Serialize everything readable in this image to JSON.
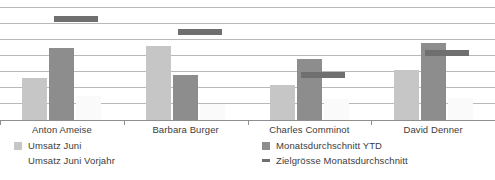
{
  "chart_data": {
    "type": "bar",
    "title": "",
    "xlabel": "",
    "ylabel": "",
    "grid": true,
    "legend_position": "bottom",
    "ylim": [
      0,
      7
    ],
    "gridline_values": [
      1,
      2,
      3,
      4,
      5,
      6,
      7
    ],
    "categories": [
      "Anton Ameise",
      "Barbara Burger",
      "Charles Comminot",
      "David Denner"
    ],
    "series": [
      {
        "name": "Umsatz Juni",
        "color": "#c6c6c6",
        "values": [
          2.6,
          4.6,
          2.2,
          3.1
        ]
      },
      {
        "name": "Monatsdurchschnitt YTD",
        "color": "#8d8d8d",
        "values": [
          4.5,
          2.8,
          3.8,
          4.8
        ]
      },
      {
        "name": "Umsatz Juni Vorjahr",
        "color": "#fafafa",
        "values": [
          1.5,
          1.0,
          1.3,
          1.4
        ]
      }
    ],
    "target_marker": {
      "name": "Zielgrösse Monatsdurchschnitt",
      "color": "#6f6f6f",
      "values": [
        6.1,
        5.3,
        2.6,
        4.0
      ]
    }
  },
  "legend": {
    "left": [
      {
        "label": "Umsatz Juni",
        "swatch": "s1"
      },
      {
        "label": "Umsatz Juni Vorjahr",
        "swatch": "s3"
      }
    ],
    "right": [
      {
        "label": "Monatsdurchschnitt YTD",
        "swatch": "s2"
      },
      {
        "label": "Zielgrösse Monatsdurchschnitt",
        "swatch": "tgt"
      }
    ]
  },
  "footnote": ""
}
